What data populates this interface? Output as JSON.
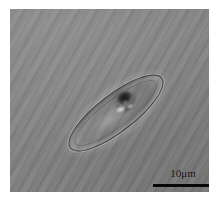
{
  "figure": {
    "kind": "optical-micrograph",
    "modality_hint": "phase-contrast / DIC brightfield micrograph",
    "alt": "Grayscale micrograph of an elongated lens-shaped cell with a dark central inclusion",
    "background_color": "#828282",
    "border_color": "#ffffff"
  },
  "specimen": {
    "outline_name": "elongated lens-shaped cell outline",
    "core_name": "dark central inclusion",
    "outline_color": "#222222",
    "core_color": "#1d1d1d",
    "highlight_color": "#e8e8e8",
    "orientation_degrees": -37.5
  },
  "scale_bar": {
    "label": "10μm",
    "value": 10,
    "unit": "μm",
    "bar_color": "#080808",
    "label_color": "#101010",
    "length_px": 58
  }
}
